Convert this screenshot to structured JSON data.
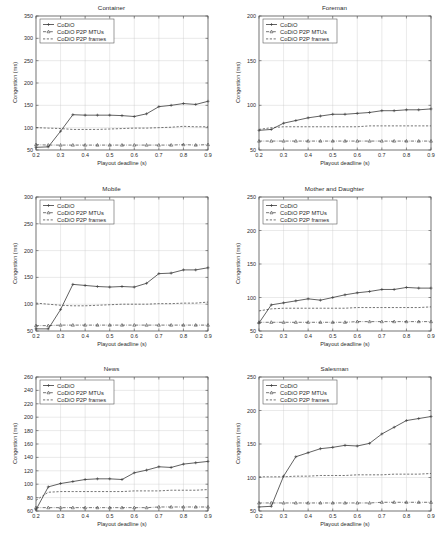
{
  "figure": {
    "series_labels": {
      "codio": "CoDiO",
      "mtus": "CoDiO P2P MTUs",
      "frames": "CoDiO P2P frames"
    },
    "axis_labels": {
      "x": "Playout deadline (s)",
      "y": "Congestion (ms)"
    },
    "colors": {
      "line": "#3a3a3a",
      "grid": "#c9c9c9",
      "frame": "#4a4a4a",
      "background": "#ffffff"
    }
  },
  "chart_data": [
    {
      "type": "line",
      "title": "Container",
      "xlabel": "Playout deadline (s)",
      "ylabel": "Congestion (ms)",
      "xlim": [
        0.2,
        0.9
      ],
      "ylim": [
        50,
        350
      ],
      "xticks": [
        0.2,
        0.3,
        0.4,
        0.5,
        0.6,
        0.7,
        0.8,
        0.9
      ],
      "xticklabels": [
        "0.2",
        "0.3",
        "0.4",
        "0.5",
        "0.6",
        "0.7",
        "0.8",
        "0.9"
      ],
      "yticks": [
        50,
        100,
        150,
        200,
        250,
        300,
        350
      ],
      "yticklabels": [
        "50",
        "100",
        "150",
        "200",
        "250",
        "300",
        "350"
      ],
      "grid": true,
      "legend_position": "upper-left",
      "x": [
        0.2,
        0.25,
        0.3,
        0.35,
        0.4,
        0.45,
        0.5,
        0.55,
        0.6,
        0.65,
        0.7,
        0.75,
        0.8,
        0.85,
        0.9
      ],
      "series": [
        {
          "name": "CoDiO",
          "values": [
            56,
            57,
            92,
            129,
            128,
            128,
            128,
            127,
            125,
            131,
            147,
            150,
            154,
            152,
            159
          ]
        },
        {
          "name": "CoDiO P2P MTUs",
          "values": [
            62,
            61,
            61,
            61,
            61,
            61,
            61,
            61,
            61,
            61,
            61,
            61,
            62,
            61,
            62
          ]
        },
        {
          "name": "CoDiO P2P frames",
          "values": [
            100,
            99,
            98,
            96,
            96,
            96,
            97,
            98,
            99,
            99,
            100,
            101,
            103,
            102,
            102
          ]
        }
      ]
    },
    {
      "type": "line",
      "title": "Foreman",
      "xlabel": "Playout deadline (s)",
      "ylabel": "Congestion (ms)",
      "xlim": [
        0.2,
        0.9
      ],
      "ylim": [
        50,
        200
      ],
      "xticks": [
        0.2,
        0.3,
        0.4,
        0.5,
        0.6,
        0.7,
        0.8,
        0.9
      ],
      "xticklabels": [
        "0.2",
        "0.3",
        "0.4",
        "0.5",
        "0.6",
        "0.7",
        "0.8",
        "0.9"
      ],
      "yticks": [
        50,
        100,
        150,
        200
      ],
      "yticklabels": [
        "50",
        "100",
        "150",
        "200"
      ],
      "grid": true,
      "legend_position": "upper-left",
      "x": [
        0.2,
        0.25,
        0.3,
        0.35,
        0.4,
        0.45,
        0.5,
        0.55,
        0.6,
        0.65,
        0.7,
        0.75,
        0.8,
        0.85,
        0.9
      ],
      "series": [
        {
          "name": "CoDiO",
          "values": [
            72,
            73,
            80,
            83,
            86,
            88,
            90,
            90,
            91,
            92,
            94,
            94,
            95,
            95,
            96
          ]
        },
        {
          "name": "CoDiO P2P MTUs",
          "values": [
            60,
            60,
            60,
            60,
            60,
            60,
            60,
            60,
            60,
            60,
            60,
            60,
            60,
            60,
            60
          ]
        },
        {
          "name": "CoDiO P2P frames",
          "values": [
            73,
            75,
            76,
            76,
            76,
            76,
            76,
            76,
            76,
            77,
            77,
            77,
            77,
            77,
            77
          ]
        }
      ]
    },
    {
      "type": "line",
      "title": "Mobile",
      "xlabel": "Playout deadline (s)",
      "ylabel": "Congestion (ms)",
      "xlim": [
        0.2,
        0.9
      ],
      "ylim": [
        50,
        300
      ],
      "xticks": [
        0.2,
        0.3,
        0.4,
        0.5,
        0.6,
        0.7,
        0.8,
        0.9
      ],
      "xticklabels": [
        "0.2",
        "0.3",
        "0.4",
        "0.5",
        "0.6",
        "0.7",
        "0.8",
        "0.9"
      ],
      "yticks": [
        50,
        100,
        150,
        200,
        250,
        300
      ],
      "yticklabels": [
        "50",
        "100",
        "150",
        "200",
        "250",
        "300"
      ],
      "grid": true,
      "legend_position": "upper-left",
      "x": [
        0.2,
        0.25,
        0.3,
        0.35,
        0.4,
        0.45,
        0.5,
        0.55,
        0.6,
        0.65,
        0.7,
        0.75,
        0.8,
        0.85,
        0.9
      ],
      "series": [
        {
          "name": "CoDiO",
          "values": [
            54,
            54,
            90,
            137,
            135,
            133,
            132,
            133,
            132,
            139,
            157,
            158,
            164,
            164,
            168
          ]
        },
        {
          "name": "CoDiO P2P MTUs",
          "values": [
            60,
            60,
            61,
            61,
            61,
            61,
            61,
            61,
            61,
            61,
            61,
            61,
            61,
            61,
            61
          ]
        },
        {
          "name": "CoDiO P2P frames",
          "values": [
            102,
            100,
            98,
            97,
            97,
            98,
            99,
            100,
            100,
            100,
            101,
            101,
            102,
            102,
            104
          ]
        }
      ]
    },
    {
      "type": "line",
      "title": "Mother and Daughter",
      "xlabel": "Playout deadline (s)",
      "ylabel": "Congestion (ms)",
      "xlim": [
        0.2,
        0.9
      ],
      "ylim": [
        50,
        250
      ],
      "xticks": [
        0.2,
        0.3,
        0.4,
        0.5,
        0.6,
        0.7,
        0.8,
        0.9
      ],
      "xticklabels": [
        "0.2",
        "0.3",
        "0.4",
        "0.5",
        "0.6",
        "0.7",
        "0.8",
        "0.9"
      ],
      "yticks": [
        50,
        100,
        150,
        200,
        250
      ],
      "yticklabels": [
        "50",
        "100",
        "150",
        "200",
        "250"
      ],
      "grid": true,
      "legend_position": "upper-left",
      "x": [
        0.2,
        0.25,
        0.3,
        0.35,
        0.4,
        0.45,
        0.5,
        0.55,
        0.6,
        0.65,
        0.7,
        0.75,
        0.8,
        0.85,
        0.9
      ],
      "series": [
        {
          "name": "CoDiO",
          "values": [
            62,
            89,
            92,
            95,
            98,
            96,
            100,
            104,
            107,
            109,
            112,
            112,
            115,
            114,
            114
          ]
        },
        {
          "name": "CoDiO P2P MTUs",
          "values": [
            63,
            63,
            63,
            63,
            63,
            63,
            63,
            63,
            64,
            64,
            64,
            64,
            64,
            64,
            64
          ]
        },
        {
          "name": "CoDiO P2P frames",
          "values": [
            80,
            83,
            84,
            84,
            84,
            84,
            84,
            84,
            85,
            85,
            85,
            85,
            85,
            85,
            86
          ]
        }
      ]
    },
    {
      "type": "line",
      "title": "News",
      "xlabel": "Playout deadline (s)",
      "ylabel": "Congestion (ms)",
      "xlim": [
        0.2,
        0.9
      ],
      "ylim": [
        60,
        260
      ],
      "xticks": [
        0.2,
        0.3,
        0.4,
        0.5,
        0.6,
        0.7,
        0.8,
        0.9
      ],
      "xticklabels": [
        "0.2",
        "0.3",
        "0.4",
        "0.5",
        "0.6",
        "0.7",
        "0.8",
        "0.9"
      ],
      "yticks": [
        60,
        80,
        100,
        120,
        140,
        160,
        180,
        200,
        220,
        240,
        260
      ],
      "yticklabels": [
        "60",
        "80",
        "100",
        "120",
        "140",
        "160",
        "180",
        "200",
        "220",
        "240",
        "260"
      ],
      "grid": true,
      "legend_position": "upper-left",
      "x": [
        0.2,
        0.25,
        0.3,
        0.35,
        0.4,
        0.45,
        0.5,
        0.55,
        0.6,
        0.65,
        0.7,
        0.75,
        0.8,
        0.85,
        0.9
      ],
      "series": [
        {
          "name": "CoDiO",
          "values": [
            62,
            96,
            101,
            104,
            107,
            108,
            108,
            107,
            117,
            121,
            126,
            125,
            130,
            132,
            134
          ]
        },
        {
          "name": "CoDiO P2P MTUs",
          "values": [
            65,
            65,
            65,
            65,
            65,
            65,
            65,
            65,
            65,
            65,
            66,
            66,
            66,
            66,
            66
          ]
        },
        {
          "name": "CoDiO P2P frames",
          "values": [
            76,
            88,
            89,
            89,
            89,
            89,
            89,
            89,
            90,
            90,
            90,
            91,
            91,
            91,
            92
          ]
        }
      ]
    },
    {
      "type": "line",
      "title": "Salesman",
      "xlabel": "Playout deadline (s)",
      "ylabel": "Congestion (ms)",
      "xlim": [
        0.2,
        0.9
      ],
      "ylim": [
        50,
        250
      ],
      "xticks": [
        0.2,
        0.3,
        0.4,
        0.5,
        0.6,
        0.7,
        0.8,
        0.9
      ],
      "xticklabels": [
        "0.2",
        "0.3",
        "0.4",
        "0.5",
        "0.6",
        "0.7",
        "0.8",
        "0.9"
      ],
      "yticks": [
        50,
        100,
        150,
        200,
        250
      ],
      "yticklabels": [
        "50",
        "100",
        "150",
        "200",
        "250"
      ],
      "grid": true,
      "legend_position": "upper-left",
      "x": [
        0.2,
        0.25,
        0.3,
        0.35,
        0.4,
        0.45,
        0.5,
        0.55,
        0.6,
        0.65,
        0.7,
        0.75,
        0.8,
        0.85,
        0.9
      ],
      "series": [
        {
          "name": "CoDiO",
          "values": [
            56,
            57,
            102,
            131,
            137,
            143,
            145,
            148,
            147,
            151,
            165,
            175,
            185,
            188,
            191
          ]
        },
        {
          "name": "CoDiO P2P MTUs",
          "values": [
            62,
            62,
            62,
            62,
            62,
            62,
            62,
            62,
            62,
            62,
            63,
            63,
            63,
            63,
            63
          ]
        },
        {
          "name": "CoDiO P2P frames",
          "values": [
            101,
            101,
            101,
            102,
            102,
            103,
            103,
            103,
            104,
            104,
            104,
            105,
            105,
            105,
            106
          ]
        }
      ]
    }
  ]
}
